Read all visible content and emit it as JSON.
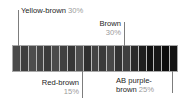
{
  "figure": {
    "type": "banded-strip-annotated",
    "background_color": "#ffffff"
  },
  "annotations": [
    {
      "id": "yellow-brown",
      "name": "Yellow-brown",
      "percent": "30%",
      "position": "top-left",
      "leader_x": 18,
      "text_color": "#1d1d1d",
      "percent_color": "#9b9b9b"
    },
    {
      "id": "brown",
      "name": "Brown",
      "percent": "30%",
      "position": "top-right",
      "leader_x": 124,
      "text_color": "#1d1d1d",
      "percent_color": "#9b9b9b"
    },
    {
      "id": "red-brown",
      "name": "Red-brown",
      "percent": "15%",
      "position": "bottom-left",
      "leader_x": 82,
      "text_color": "#1d1d1d",
      "percent_color": "#9b9b9b"
    },
    {
      "id": "ab-purple-brown",
      "name": "AB purple-",
      "name_line2": "brown",
      "percent": "25%",
      "position": "bottom-right",
      "leader_x": 172,
      "text_color": "#1d1d1d",
      "percent_color": "#9b9b9b"
    }
  ],
  "strip": {
    "x": 12,
    "y": 45,
    "width": 166,
    "height": 27,
    "separator_color": "#b9b9b9",
    "border_color": "#a8a8a8",
    "lane_count": 21,
    "lane_colors": [
      "#4a4a4a",
      "#3e3e3e",
      "#4d4d4d",
      "#454545",
      "#3b3b3b",
      "#4b4b4b",
      "#414141",
      "#373737",
      "#4e4e4e",
      "#2f2f2f",
      "#444444",
      "#3a3a3a",
      "#484848",
      "#333333",
      "#3f3f3f",
      "#2b2b2b",
      "#1e1e1e",
      "#111111",
      "#171717",
      "#0c0c0c",
      "#141414"
    ]
  }
}
